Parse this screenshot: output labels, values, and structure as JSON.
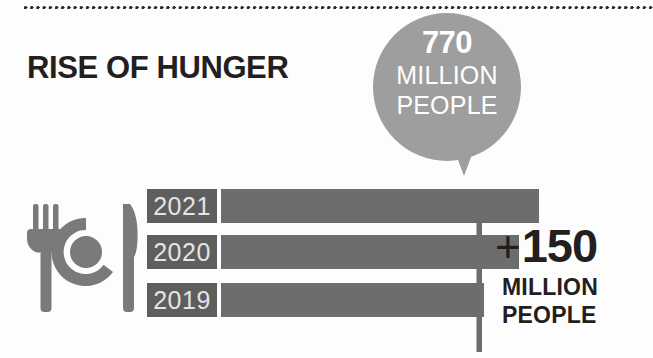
{
  "canvas": {
    "width": 653,
    "height": 358,
    "background": "#fdfdfd"
  },
  "decor": {
    "dotted_rule_name": "dotted-divider"
  },
  "header": {
    "title": "RISE OF HUNGER"
  },
  "callout": {
    "number": "770",
    "unit": "MILLION",
    "noun": "PEOPLE",
    "color": "#9e9e9e",
    "text_color": "#ffffff"
  },
  "icon": {
    "name": "fork-plate-knife-icon",
    "color": "#7a7a7a"
  },
  "delta": {
    "sign": "+",
    "value": "150",
    "unit": "MILLION",
    "noun": "PEOPLE",
    "arrow_color": "#6d6d6d",
    "text_color": "#231f20"
  },
  "chart_data": {
    "type": "bar",
    "orientation": "horizontal",
    "title": "RISE OF HUNGER",
    "xlabel": "",
    "ylabel": "",
    "categories": [
      "2021",
      "2020",
      "2019"
    ],
    "values": [
      770,
      713,
      620
    ],
    "unit": "million people",
    "bar_pixel_widths": [
      318,
      298,
      263
    ],
    "bar_color": "#6d6d6d",
    "label_tag_color": "#5e5e5e",
    "label_text_color": "#e4e4e4",
    "grid": false,
    "legend": false,
    "annotations": [
      {
        "text": "770 MILLION PEOPLE",
        "target": "2021"
      },
      {
        "text": "+150 MILLION PEOPLE",
        "target": "growth 2019 to 2021"
      }
    ]
  }
}
